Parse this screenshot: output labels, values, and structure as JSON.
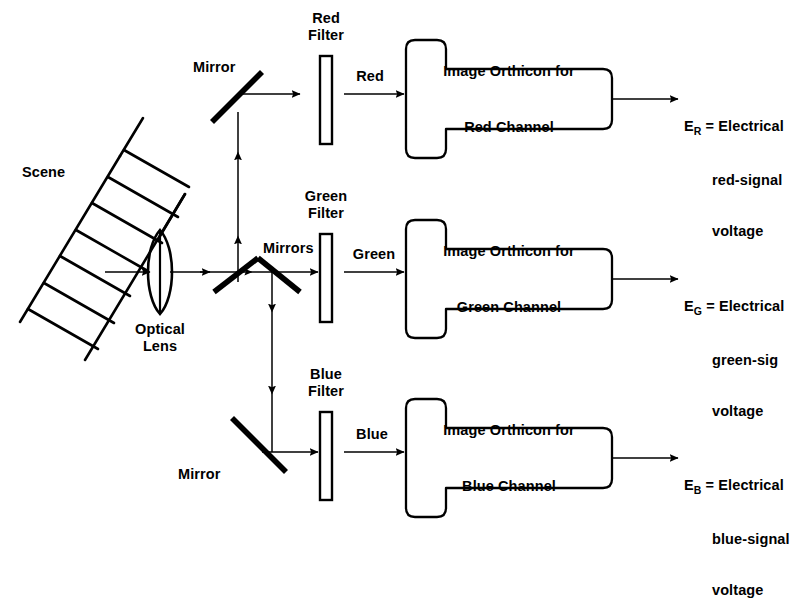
{
  "figure": {
    "stroke_color": "#000000",
    "background_color": "#ffffff"
  },
  "scene": {
    "label": "Scene"
  },
  "lens": {
    "label_line1": "Optical",
    "label_line2": "Lens"
  },
  "beam_splitters": {
    "top_mirror_label": "Mirror",
    "center_mirrors_label": "Mirrors",
    "bottom_mirror_label": "Mirror"
  },
  "channels": [
    {
      "id": "red",
      "filter_line1": "Red",
      "filter_line2": "Filter",
      "beam_label": "Red",
      "orthicon_line1": "Image Orthicon for",
      "orthicon_line2": "Red Channel",
      "output_symbol": "E",
      "output_subscript": "R",
      "output_equals": "=",
      "output_line1": "Electrical",
      "output_line2": "red-signal",
      "output_line3": "voltage"
    },
    {
      "id": "green",
      "filter_line1": "Green",
      "filter_line2": "Filter",
      "beam_label": "Green",
      "orthicon_line1": "Image Orthicon for",
      "orthicon_line2": "Green Channel",
      "output_symbol": "E",
      "output_subscript": "G",
      "output_equals": "=",
      "output_line1": "Electrical",
      "output_line2": "green-sig",
      "output_line3": "voltage"
    },
    {
      "id": "blue",
      "filter_line1": "Blue",
      "filter_line2": "Filter",
      "beam_label": "Blue",
      "orthicon_line1": "Image Orthicon for",
      "orthicon_line2": "Blue Channel",
      "output_symbol": "E",
      "output_subscript": "B",
      "output_equals": "=",
      "output_line1": "Electrical",
      "output_line2": "blue-signal",
      "output_line3": "voltage"
    }
  ]
}
